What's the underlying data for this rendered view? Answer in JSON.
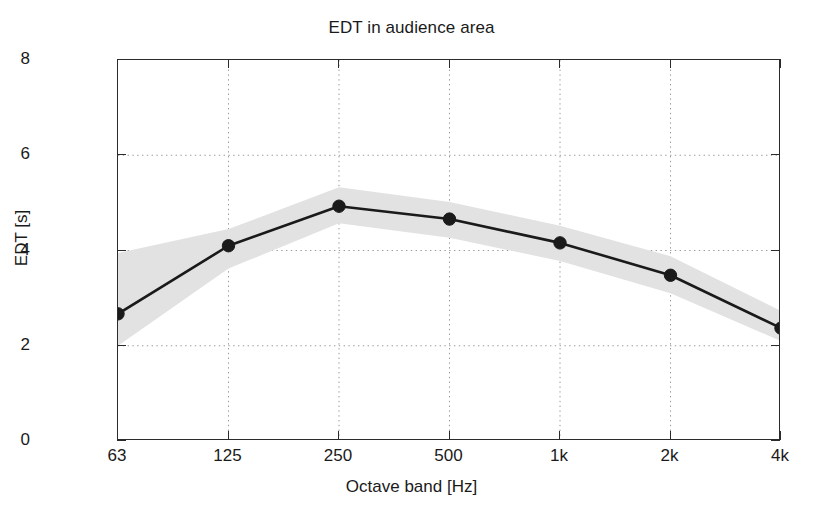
{
  "chart_data": {
    "type": "line",
    "title": "EDT in audience area",
    "xlabel": "Octave band [Hz]",
    "ylabel": "EDT [s]",
    "categories": [
      "63",
      "125",
      "250",
      "500",
      "1k",
      "2k",
      "4k"
    ],
    "x_values": [
      63,
      125,
      250,
      500,
      1000,
      2000,
      4000
    ],
    "values": [
      2.67,
      4.1,
      4.93,
      4.66,
      4.16,
      3.48,
      2.37
    ],
    "series": [
      {
        "name": "EDT mean",
        "values": [
          2.67,
          4.1,
          4.93,
          4.66,
          4.16,
          3.48,
          2.37
        ],
        "marker": "filled-circle",
        "color": "#1a1a1a",
        "line_width": 2.6
      }
    ],
    "band": {
      "name": "spatial spread",
      "upper": [
        3.95,
        4.45,
        5.33,
        5.02,
        4.52,
        3.88,
        2.73
      ],
      "lower": [
        2.0,
        3.62,
        4.57,
        4.27,
        3.78,
        3.1,
        2.1
      ],
      "color": "#e2e2e2"
    },
    "ylim": [
      0,
      8
    ],
    "yticks": [
      "0",
      "2",
      "4",
      "6",
      "8"
    ],
    "ytick_values": [
      0,
      2,
      4,
      6,
      8
    ],
    "xticks": [
      "63",
      "125",
      "250",
      "500",
      "1k",
      "2k",
      "4k"
    ],
    "grid": "dotted-both-axes",
    "grid_color": "#9a9a9a",
    "legend": "none",
    "axes_color": "#2b2b2b",
    "background": "#ffffff"
  }
}
